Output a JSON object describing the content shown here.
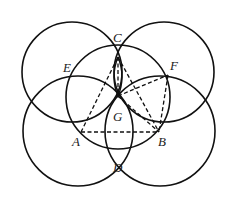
{
  "diagram": {
    "type": "geometry-construction",
    "points": {
      "A": {
        "label": "A",
        "x": 81,
        "y": 132
      },
      "B": {
        "label": "B",
        "x": 159,
        "y": 132
      },
      "C": {
        "label": "C",
        "x": 118,
        "y": 57
      },
      "D": {
        "label": "D",
        "x": 119,
        "y": 157
      },
      "E": {
        "label": "E",
        "x": 70,
        "y": 76
      },
      "F": {
        "label": "F",
        "x": 168,
        "y": 75
      },
      "G": {
        "label": "G",
        "x": 118,
        "y": 96
      }
    },
    "labels": [
      {
        "id": "C",
        "text": "C",
        "x": 113,
        "y": 42
      },
      {
        "id": "E",
        "text": "E",
        "x": 63,
        "y": 72
      },
      {
        "id": "F",
        "text": "F",
        "x": 170,
        "y": 70
      },
      {
        "id": "G",
        "text": "G",
        "x": 113,
        "y": 121
      },
      {
        "id": "A",
        "text": "A",
        "x": 72,
        "y": 146
      },
      {
        "id": "B",
        "text": "B",
        "x": 158,
        "y": 146
      },
      {
        "id": "D",
        "text": "D",
        "x": 113,
        "y": 172
      }
    ],
    "circles": [
      {
        "name": "top-left-circle",
        "cx": 72,
        "cy": 72,
        "r": 50
      },
      {
        "name": "top-right-circle",
        "cx": 164,
        "cy": 72,
        "r": 50
      },
      {
        "name": "center-circle-g",
        "cx": 118,
        "cy": 97,
        "r": 52
      },
      {
        "name": "bottom-left-circle-a",
        "cx": 78,
        "cy": 131,
        "r": 55
      },
      {
        "name": "bottom-right-circle-b",
        "cx": 160,
        "cy": 131,
        "r": 55
      }
    ],
    "segments_dashed": [
      [
        "A",
        "B"
      ],
      [
        "A",
        "C"
      ],
      [
        "C",
        "G"
      ],
      [
        "C",
        "B"
      ],
      [
        "G",
        "F"
      ],
      [
        "G",
        "B"
      ],
      [
        "F",
        "B"
      ]
    ],
    "colors": {
      "stroke": "#111111",
      "background": "#ffffff"
    }
  }
}
